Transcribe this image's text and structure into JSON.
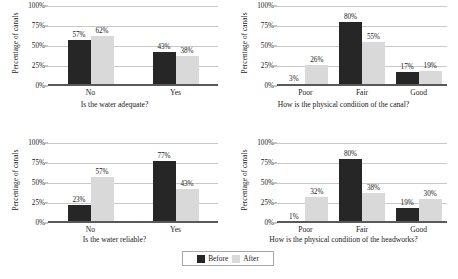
{
  "figure": {
    "background": "#ffffff",
    "before_color": "#262626",
    "after_color": "#d9d9d9",
    "gridline_color": "#c8c8c8",
    "axis_color": "#595959"
  },
  "legend": {
    "items": [
      {
        "label": "Before",
        "swatch": "before-swatch",
        "color": "#262626"
      },
      {
        "label": "After",
        "swatch": "after-swatch",
        "color": "#d9d9d9"
      }
    ]
  },
  "yaxis": {
    "title": "Percentage of canals",
    "ticks": [
      "0%",
      "25%",
      "50%",
      "75%",
      "100%"
    ],
    "tick_values": [
      0,
      25,
      50,
      75,
      100
    ],
    "min": 0,
    "max": 100
  },
  "chart_data": [
    {
      "id": "water-adequate",
      "type": "bar",
      "title": "",
      "xlabel": "Is the water adequate?",
      "ylabel": "Percentage of canals",
      "categories": [
        "No",
        "Yes"
      ],
      "series": [
        {
          "name": "Before",
          "values": [
            57,
            43
          ],
          "labels": [
            "57%",
            "43%"
          ]
        },
        {
          "name": "After",
          "values": [
            62,
            38
          ],
          "labels": [
            "62%",
            "38%"
          ]
        }
      ],
      "ylim": [
        0,
        100
      ],
      "yticks": [
        "0%",
        "25%",
        "50%",
        "75%",
        "100%"
      ],
      "grid": true,
      "legend_position": "bottom-center-shared"
    },
    {
      "id": "canal-condition",
      "type": "bar",
      "title": "",
      "xlabel": "How is the physical condition of the canal?",
      "ylabel": "Percentage of canals",
      "categories": [
        "Poor",
        "Fair",
        "Good"
      ],
      "series": [
        {
          "name": "Before",
          "values": [
            3,
            80,
            17
          ],
          "labels": [
            "3%",
            "80%",
            "17%"
          ]
        },
        {
          "name": "After",
          "values": [
            26,
            55,
            19
          ],
          "labels": [
            "26%",
            "55%",
            "19%"
          ]
        }
      ],
      "ylim": [
        0,
        100
      ],
      "yticks": [
        "0%",
        "25%",
        "50%",
        "75%",
        "100%"
      ],
      "grid": true,
      "legend_position": "bottom-center-shared"
    },
    {
      "id": "water-reliable",
      "type": "bar",
      "title": "",
      "xlabel": "Is the water reliable?",
      "ylabel": "Percentage of canals",
      "categories": [
        "No",
        "Yes"
      ],
      "series": [
        {
          "name": "Before",
          "values": [
            23,
            77
          ],
          "labels": [
            "23%",
            "77%"
          ]
        },
        {
          "name": "After",
          "values": [
            57,
            43
          ],
          "labels": [
            "57%",
            "43%"
          ]
        }
      ],
      "ylim": [
        0,
        100
      ],
      "yticks": [
        "0%",
        "25%",
        "50%",
        "75%",
        "100%"
      ],
      "grid": true,
      "legend_position": "bottom-center-shared"
    },
    {
      "id": "headworks-condition",
      "type": "bar",
      "title": "",
      "xlabel": "How is the physical condition of the headworks?",
      "ylabel": "Percentage of canals",
      "categories": [
        "Poor",
        "Fair",
        "Good"
      ],
      "series": [
        {
          "name": "Before",
          "values": [
            1,
            80,
            19
          ],
          "labels": [
            "1%",
            "80%",
            "19%"
          ]
        },
        {
          "name": "After",
          "values": [
            32,
            38,
            30
          ],
          "labels": [
            "32%",
            "38%",
            "30%"
          ]
        }
      ],
      "ylim": [
        0,
        100
      ],
      "yticks": [
        "0%",
        "25%",
        "50%",
        "75%",
        "100%"
      ],
      "grid": true,
      "legend_position": "bottom-center-shared"
    }
  ]
}
